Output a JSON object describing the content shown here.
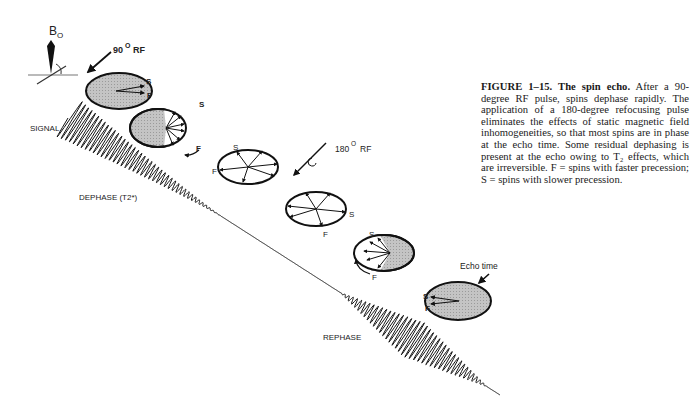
{
  "figure": {
    "field_label": "B",
    "field_subscript": "O",
    "pulse_90_label": "90",
    "pulse_90_unit": "RF",
    "pulse_180_label": "180",
    "pulse_180_unit": "RF",
    "degree_mark": "O",
    "signal_label": "SIGNAL",
    "dephase_label": "DEPHASE (T2*)",
    "rephase_label": "REPHASE",
    "echo_time_label": "Echo time",
    "slow_label": "S",
    "fast_label": "F"
  },
  "caption": {
    "heading": "FIGURE 1–15. The spin echo.",
    "text": "After a 90-degree RF pulse, spins dephase rapidly. The application of a 180-degree refocusing pulse eliminates the effects of static magnetic field inhomogeneities, so that most spins are in phase at the echo time. Some residual dephasing is present at the echo owing to T₂ effects, which are irreversible. F = spins with faster precession; S = spins with slower precession."
  },
  "colors": {
    "ink": "#111111",
    "fill_gray": "#bdbdbd"
  }
}
